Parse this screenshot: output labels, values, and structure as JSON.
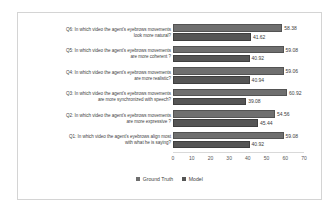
{
  "chart_data": {
    "type": "bar",
    "orientation": "horizontal",
    "title": "",
    "xlabel": "",
    "ylabel": "",
    "xlim": [
      0,
      70
    ],
    "xticks": [
      "0",
      "10",
      "20",
      "30",
      "40",
      "50",
      "60",
      "70"
    ],
    "grid": false,
    "legend_position": "bottom",
    "categories": [
      "Q6: In which video the agent's eyebrows movements look more natural?",
      "Q5: In which video the agent's eyebrows movements are more coherent ?",
      "Q4: In which video the agent's eyebrows movements are more realistic?",
      "Q3: In which video the agent's eyebrows movements are more synchronized with speech?",
      "Q2: In which video the agent's eyebrows movements are more expressive ?",
      "Q1: In which video the agent's eyebrows align most with what he is saying?"
    ],
    "category_lines": [
      [
        "Q6: In which video the agent's eyebrows movements",
        "look more natural?"
      ],
      [
        "Q5: In which video the agent's eyebrows movements",
        "are more coherent ?"
      ],
      [
        "Q4: In which video the agent's eyebrows movements",
        "are more realistic?"
      ],
      [
        "Q3: In which video the agent's eyebrows movements",
        "are more synchronized with speech?"
      ],
      [
        "Q2: In which video the agent's eyebrows movements",
        "are more expressive ?"
      ],
      [
        "Q1: In which video the agent's eyebrows align most",
        "with what he is saying?"
      ]
    ],
    "series": [
      {
        "name": "Ground Truth",
        "color": "#6f6f6f",
        "values": [
          58.38,
          59.08,
          59.06,
          60.92,
          54.56,
          59.08
        ],
        "labels": [
          "58.38",
          "59.08",
          "59.06",
          "60.92",
          "54.56",
          "59.08"
        ]
      },
      {
        "name": "Model",
        "color": "#555555",
        "values": [
          41.62,
          40.92,
          40.94,
          39.08,
          45.44,
          40.92
        ],
        "labels": [
          "41.62",
          "40.92",
          "40.94",
          "39.08",
          "45.44",
          "40.92"
        ]
      }
    ]
  },
  "legend": {
    "items": [
      {
        "label": "Ground Truth",
        "color": "#6f6f6f"
      },
      {
        "label": "Model",
        "color": "#555555"
      }
    ]
  }
}
